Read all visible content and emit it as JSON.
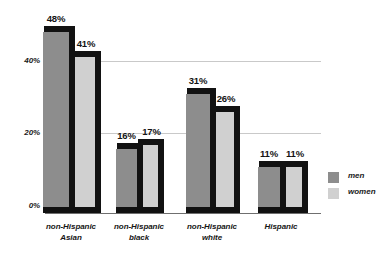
{
  "chart_data": {
    "type": "bar",
    "title": "",
    "subtitle": "",
    "xlabel": "",
    "ylabel": "",
    "ylim": [
      0,
      50
    ],
    "yticks": [
      "0%",
      "20%",
      "40%"
    ],
    "ytick_values": [
      0,
      20,
      40
    ],
    "grid": "horizontal-only",
    "grid_at": [
      20,
      40
    ],
    "legend_position": "right",
    "value_label_suffix": "%",
    "categories": [
      "non-Hispanic Asian",
      "non-Hispanic black",
      "non-Hispanic white",
      "Hispanic"
    ],
    "category_lines": [
      [
        "non-Hispanic",
        "Asian"
      ],
      [
        "non-Hispanic",
        "black"
      ],
      [
        "non-Hispanic",
        "white"
      ],
      [
        "Hispanic",
        ""
      ]
    ],
    "series": [
      {
        "name": "men",
        "color": "#8d8d8d",
        "values": [
          48,
          16,
          31,
          11
        ],
        "labels": [
          "48%",
          "16%",
          "31%",
          "11%"
        ]
      },
      {
        "name": "women",
        "color": "#d0d0d0",
        "values": [
          41,
          17,
          26,
          11
        ],
        "labels": [
          "41%",
          "17%",
          "26%",
          "11%"
        ]
      }
    ]
  },
  "legend": {
    "items": [
      {
        "label": "men",
        "color": "#8d8d8d"
      },
      {
        "label": "women",
        "color": "#d0d0d0"
      }
    ]
  },
  "axis": {
    "tick_0": "0%",
    "tick_20": "20%",
    "tick_40": "40%"
  },
  "colors": {
    "men": "#8d8d8d",
    "women": "#d0d0d0",
    "shadow": "#121212",
    "gridline": "#c9c9c9",
    "text": "#141414"
  }
}
